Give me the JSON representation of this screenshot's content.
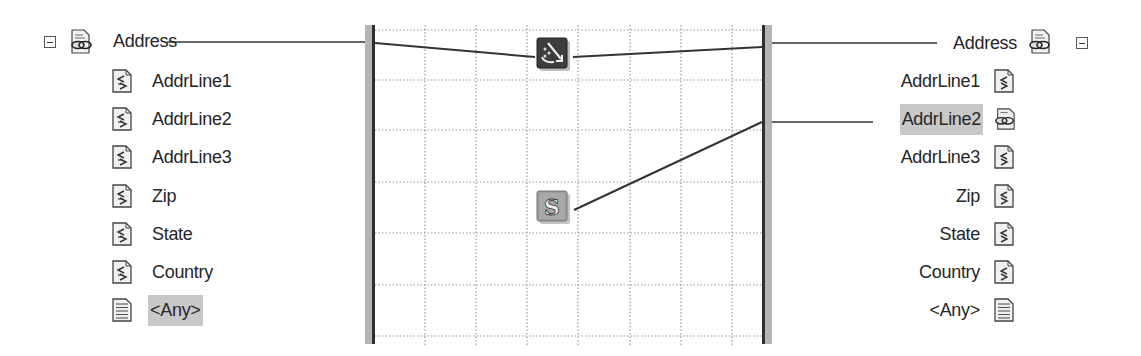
{
  "source_schema": {
    "root": {
      "label": "Address",
      "icon": "record-link-icon",
      "expanded": true
    },
    "children": [
      {
        "label": "AddrLine1",
        "icon": "field-element-icon",
        "selected": false
      },
      {
        "label": "AddrLine2",
        "icon": "field-element-icon",
        "selected": false
      },
      {
        "label": "AddrLine3",
        "icon": "field-element-icon",
        "selected": false
      },
      {
        "label": "Zip",
        "icon": "field-element-icon",
        "selected": false
      },
      {
        "label": "State",
        "icon": "field-element-icon",
        "selected": false
      },
      {
        "label": "Country",
        "icon": "field-element-icon",
        "selected": false
      },
      {
        "label": "<Any>",
        "icon": "any-element-icon",
        "selected": true
      }
    ]
  },
  "destination_schema": {
    "root": {
      "label": "Address",
      "icon": "record-link-icon",
      "expanded": true
    },
    "children": [
      {
        "label": "AddrLine1",
        "icon": "field-element-icon",
        "selected": false
      },
      {
        "label": "AddrLine2",
        "icon": "linked-field-icon",
        "selected": true
      },
      {
        "label": "AddrLine3",
        "icon": "field-element-icon",
        "selected": false
      },
      {
        "label": "Zip",
        "icon": "field-element-icon",
        "selected": false
      },
      {
        "label": "State",
        "icon": "field-element-icon",
        "selected": false
      },
      {
        "label": "Country",
        "icon": "field-element-icon",
        "selected": false
      },
      {
        "label": "<Any>",
        "icon": "any-element-icon",
        "selected": false
      }
    ]
  },
  "functoids": [
    {
      "name": "mass-copy-functoid",
      "icon": "mass-copy-icon",
      "symbol": "↘"
    },
    {
      "name": "string-functoid",
      "icon": "string-icon",
      "symbol": "S"
    }
  ],
  "links": [
    {
      "from": "source.Address",
      "to": "functoid.mass-copy"
    },
    {
      "from": "functoid.mass-copy",
      "to": "destination.Address"
    },
    {
      "from": "functoid.string",
      "to": "destination.AddrLine2"
    }
  ],
  "colors": {
    "background": "#ffffff",
    "selection": "#c8c8c8",
    "link_line": "#333333",
    "grid_line": "#9a9a9a",
    "border_bar_dark": "#2e2e2e",
    "border_bar_light": "#b4b4b4"
  }
}
